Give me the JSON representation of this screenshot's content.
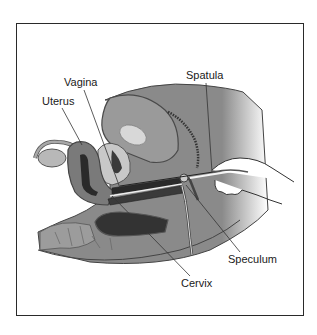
{
  "figure": {
    "labels": {
      "vagina": "Vagina",
      "uterus": "Uterus",
      "spatula": "Spatula",
      "speculum": "Speculum",
      "cervix": "Cervix"
    },
    "colors": {
      "frame": "#2a2a2a",
      "tissue": "#8c8c8c",
      "tissue_light": "#b4b4b4",
      "dark_cavity": "#2e2e2e",
      "outline": "#444444",
      "leader_line": "#333333"
    }
  }
}
